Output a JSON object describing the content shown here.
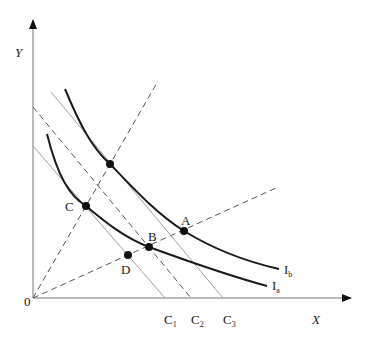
{
  "diagram": {
    "type": "indifference-curve-budget-diagram",
    "colors": {
      "axis": "#777777",
      "budget_line": "#a0a0a0",
      "dashed": "#555555",
      "curve": "#1a1a1a",
      "point": "#111111",
      "text": "#222222"
    },
    "axes": {
      "origin_label": "0",
      "x_label": "X",
      "y_label": "Y"
    },
    "budget_lines": [
      {
        "id": "C1",
        "label": "C",
        "subscript": "1",
        "style": "solid"
      },
      {
        "id": "C2",
        "label": "C",
        "subscript": "2",
        "style": "dashed"
      },
      {
        "id": "C3",
        "label": "C",
        "subscript": "3",
        "style": "solid"
      }
    ],
    "curves": [
      {
        "id": "Ia",
        "label": "I",
        "subscript": "a"
      },
      {
        "id": "Ib",
        "label": "I",
        "subscript": "b"
      }
    ],
    "rays": [
      {
        "id": "steep-ray",
        "style": "dashed"
      },
      {
        "id": "shallow-ray",
        "style": "dashed"
      }
    ],
    "points": [
      {
        "id": "A",
        "label": "A"
      },
      {
        "id": "B",
        "label": "B"
      },
      {
        "id": "C",
        "label": "C"
      },
      {
        "id": "D",
        "label": "D"
      },
      {
        "id": "E",
        "label": ""
      }
    ]
  }
}
